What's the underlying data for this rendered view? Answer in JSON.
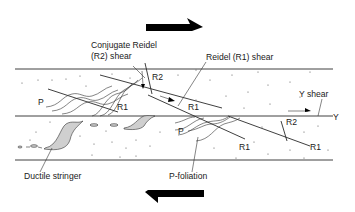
{
  "diagram": {
    "type": "shear zone structure schematic",
    "sense_of_shear": "dextral",
    "top_arrow": {
      "direction": "right"
    },
    "bottom_arrow": {
      "direction": "left"
    },
    "labels": {
      "conjugate_reidel_line1": "Conjugate Reidel",
      "conjugate_reidel_line2": "(R2) shear",
      "reidel_r1": "Reidel (R1) shear",
      "y_shear": "Y shear",
      "y": "Y",
      "r2_upper": "R2",
      "r2_lower": "R2",
      "p_upper": "P",
      "p_lower": "P",
      "r1_a": "R1",
      "r1_b": "R1",
      "r1_c": "R1",
      "r1_d": "R1",
      "ductile_stringer": "Ductile stringer",
      "p_foliation": "P-foliation"
    },
    "colors": {
      "line": "#2a2a2a",
      "arrow": "#000000",
      "stringer_fill": "#cfcfcf",
      "background": "#ffffff"
    }
  }
}
